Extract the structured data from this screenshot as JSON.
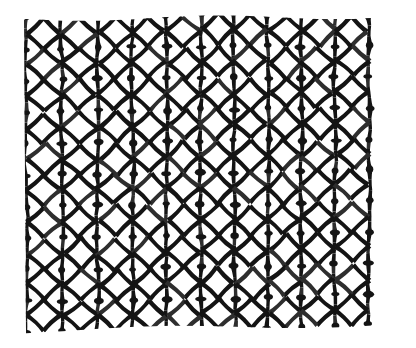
{
  "image": {
    "kind": "photograph",
    "subject": "expanded-metal-mesh",
    "alt_text": "Close-up photograph of a black expanded metal / woven wire mesh with hexagonal-diamond shaped openings on a white background",
    "canvas": {
      "width": 416,
      "height": 348
    },
    "background_color": "#ffffff",
    "strand_color": "#141414",
    "strand_color_light": "#2e2e2e",
    "paper_tone": "#fdfdfd"
  },
  "mesh": {
    "region": {
      "x": 26,
      "y": 18,
      "width": 364,
      "height": 314
    },
    "rows": 10,
    "cols": 10,
    "cell_width_left": 44,
    "cell_width_right": 34,
    "cell_height": 32,
    "strand_thickness_min": 3.2,
    "strand_thickness_max": 6.4,
    "node_radius": 4.2,
    "row_skew_px": -7,
    "col_skew_px": 4,
    "perspective_scale_right": 0.79,
    "jitter_amplitude": 1.6,
    "waist_ratio": 0.34,
    "seed": 20240517
  },
  "labels": {
    "figure_title": "",
    "caption": "",
    "scale_bar": ""
  }
}
